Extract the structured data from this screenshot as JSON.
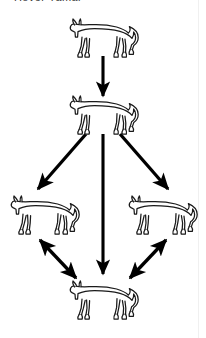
{
  "caption": {
    "text": "Hover Yamai",
    "note_truncated": true
  },
  "diagram": {
    "type": "flow-diagram",
    "subject_icon": "dog-icon",
    "stroke_color": "#000000",
    "fill_color": "#ffffff",
    "background_color": "#ffffff",
    "nodes": [
      {
        "id": "dog-top",
        "label": "dog-top",
        "x": 103,
        "y": 38,
        "scale": 1.0
      },
      {
        "id": "dog-second",
        "label": "dog-second",
        "x": 103,
        "y": 115,
        "scale": 1.0
      },
      {
        "id": "dog-left",
        "label": "dog-left",
        "x": 44,
        "y": 215,
        "scale": 1.0
      },
      {
        "id": "dog-right",
        "label": "dog-right",
        "x": 162,
        "y": 215,
        "scale": 1.0
      },
      {
        "id": "dog-bottom",
        "label": "dog-bottom",
        "x": 103,
        "y": 300,
        "scale": 1.0
      }
    ],
    "edges": [
      {
        "id": "edge-top-to-second",
        "from": "dog-top",
        "to": "dog-second",
        "heads": "single"
      },
      {
        "id": "edge-second-to-left",
        "from": "dog-second",
        "to": "dog-left",
        "heads": "single"
      },
      {
        "id": "edge-second-to-bottom",
        "from": "dog-second",
        "to": "dog-bottom",
        "heads": "single"
      },
      {
        "id": "edge-second-to-right",
        "from": "dog-second",
        "to": "dog-right",
        "heads": "single"
      },
      {
        "id": "edge-left-bottom",
        "from": "dog-left",
        "to": "dog-bottom",
        "heads": "double"
      },
      {
        "id": "edge-right-bottom",
        "from": "dog-right",
        "to": "dog-bottom",
        "heads": "double"
      }
    ]
  }
}
